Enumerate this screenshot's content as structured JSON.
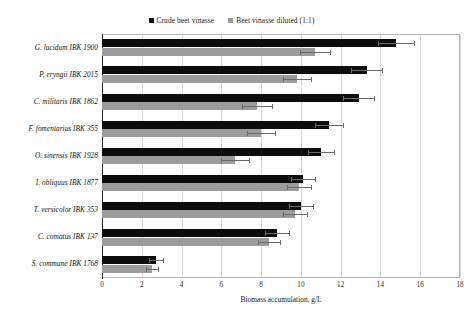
{
  "chart_data": {
    "type": "bar",
    "orientation": "horizontal",
    "title": "",
    "xlabel": "Biomass accumulation, g/L",
    "ylabel": "",
    "xlim": [
      0,
      18
    ],
    "xticks": [
      0,
      2,
      4,
      6,
      8,
      10,
      12,
      14,
      16,
      18
    ],
    "grid": true,
    "legend_position": "top-center",
    "categories": [
      "G. lucidum IBK 1900",
      "P. eryngii IBK 2015",
      "C. militaris IBK 1862",
      "F. fomentarius IBK 355",
      "O. sinensis IBK 1928",
      "I. obliquus IBK 1877",
      "T. versicolor IBK 353",
      "C. comatus IBK  137",
      "S. commune IBK 1768"
    ],
    "series": [
      {
        "name": "Crude beet vinasse",
        "color": "#0d0d0d",
        "values": [
          14.8,
          13.3,
          12.9,
          11.4,
          11.0,
          10.1,
          10.0,
          8.8,
          2.7
        ],
        "errors": [
          0.9,
          0.8,
          0.8,
          0.7,
          0.65,
          0.6,
          0.6,
          0.6,
          0.35
        ]
      },
      {
        "name": "Beet vinasse diluted (1:1)",
        "color": "#9c9c9c",
        "values": [
          10.7,
          9.8,
          7.8,
          8.0,
          6.7,
          9.9,
          9.7,
          8.4,
          2.5
        ],
        "errors": [
          0.75,
          0.7,
          0.75,
          0.7,
          0.7,
          0.6,
          0.6,
          0.55,
          0.3
        ]
      }
    ]
  },
  "legend": {
    "items": [
      {
        "label": "Crude beet vinasse",
        "color": "#0d0d0d"
      },
      {
        "label": "Beet vinasse diluted (1:1)",
        "color": "#9c9c9c"
      }
    ]
  },
  "axis": {
    "x_label": "Biomass accumulation, g/L",
    "x_tick_labels": [
      "0",
      "2",
      "4",
      "6",
      "8",
      "10",
      "12",
      "14",
      "16",
      "18"
    ]
  }
}
